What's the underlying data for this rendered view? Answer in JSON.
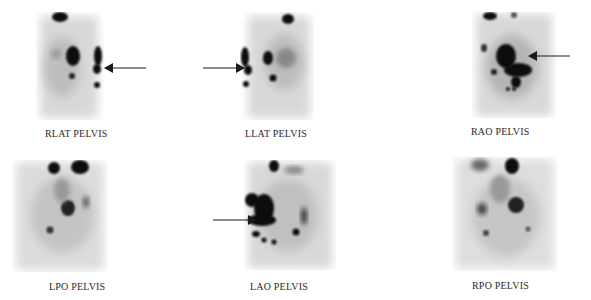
{
  "figure": {
    "panels": [
      {
        "id": "rlat",
        "label": "RLAT PELVIS",
        "arrow": true,
        "arrow_direction": "left"
      },
      {
        "id": "llat",
        "label": "LLAT PELVIS",
        "arrow": true,
        "arrow_direction": "right"
      },
      {
        "id": "rao",
        "label": "RAO PELVIS",
        "arrow": true,
        "arrow_direction": "left"
      },
      {
        "id": "lpo",
        "label": "LPO PELVIS",
        "arrow": false
      },
      {
        "id": "lao",
        "label": "LAO PELVIS",
        "arrow": true,
        "arrow_direction": "right"
      },
      {
        "id": "rpo",
        "label": "RPO PELVIS",
        "arrow": false
      }
    ],
    "colors": {
      "uptake": "#0a0a0a",
      "background": "#ffffff",
      "arrow": "#1a1a1a",
      "label": "#2a2a2a"
    }
  }
}
